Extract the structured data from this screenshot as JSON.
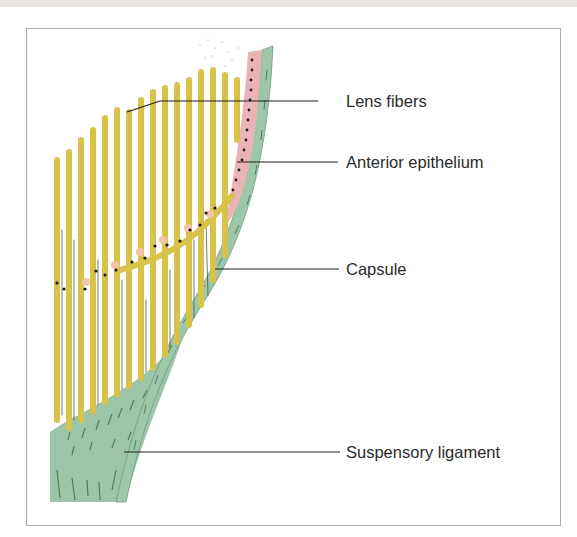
{
  "figure": {
    "colors": {
      "lens_fibers": "#d9c24a",
      "fiber_shadow": "#5a5a4a",
      "anterior_epithelium": "#eab3b6",
      "capsule": "#9dc7ab",
      "suspensory_ligament": "#9cc4a8",
      "nuclei": "#2a1a1a",
      "leader_line": "#1e1e1e",
      "frame_border": "#a9a9a9"
    },
    "labels": [
      {
        "id": "lens-fibers",
        "text": "Lens fibers"
      },
      {
        "id": "anterior-epithelium",
        "text": "Anterior epithelium"
      },
      {
        "id": "capsule",
        "text": "Capsule"
      },
      {
        "id": "suspensory-ligament",
        "text": "Suspensory ligament"
      }
    ]
  }
}
